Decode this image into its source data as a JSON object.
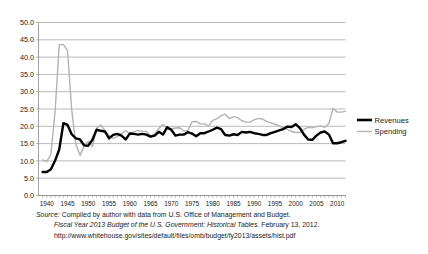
{
  "figure": {
    "background": "#ffffff",
    "plot_frame_color": "#8c8c8c",
    "grid_color": "#8c8c8c"
  },
  "legend": {
    "position": "right",
    "items": [
      {
        "label": "Revenues",
        "color": "#000000",
        "width": 2.6
      },
      {
        "label": "Spending",
        "color": "#b3b3b3",
        "width": 1.4
      }
    ]
  },
  "source": {
    "label": "Source:",
    "line1": "Compiled by author with data from U.S. Office of Management and Budget.",
    "line2_title": "Fiscal Year 2013 Budget of the U.S. Government: Historical Tables.",
    "line2_date": "February 13, 2012.",
    "line3_url": "http://www.whitehouse.gov/sites/default/files/omb/budget/fy2013/assets/hist.pdf"
  },
  "chart_data": {
    "type": "line",
    "title": "",
    "xlabel": "",
    "ylabel": "",
    "xlim": [
      1938,
      2012
    ],
    "ylim": [
      0.0,
      50.0
    ],
    "grid": true,
    "legend_position": "right",
    "ytick_labels": [
      "0.0",
      "5.0",
      "10.0",
      "15.0",
      "20.0",
      "25.0",
      "30.0",
      "35.0",
      "40.0",
      "45.0",
      "50.0"
    ],
    "ytick_values": [
      0,
      5,
      10,
      15,
      20,
      25,
      30,
      35,
      40,
      45,
      50
    ],
    "xtick_labels": [
      "1940",
      "1945",
      "1950",
      "1955",
      "1960",
      "1965",
      "1970",
      "1975",
      "1980",
      "1985",
      "1990",
      "1995",
      "2000",
      "2005",
      "2010"
    ],
    "xtick_values": [
      1940,
      1945,
      1950,
      1955,
      1960,
      1965,
      1970,
      1975,
      1980,
      1985,
      1990,
      1995,
      2000,
      2005,
      2010
    ],
    "x": [
      1939,
      1940,
      1941,
      1942,
      1943,
      1944,
      1945,
      1946,
      1947,
      1948,
      1949,
      1950,
      1951,
      1952,
      1953,
      1954,
      1955,
      1956,
      1957,
      1958,
      1959,
      1960,
      1961,
      1962,
      1963,
      1964,
      1965,
      1966,
      1967,
      1968,
      1969,
      1970,
      1971,
      1972,
      1973,
      1974,
      1975,
      1976,
      1977,
      1978,
      1979,
      1980,
      1981,
      1982,
      1983,
      1984,
      1985,
      1986,
      1987,
      1988,
      1989,
      1990,
      1991,
      1992,
      1993,
      1994,
      1995,
      1996,
      1997,
      1998,
      1999,
      2000,
      2001,
      2002,
      2003,
      2004,
      2005,
      2006,
      2007,
      2008,
      2009,
      2010,
      2011,
      2012
    ],
    "series": [
      {
        "name": "Revenues",
        "color": "#000000",
        "values": [
          6.8,
          6.8,
          7.6,
          10.1,
          13.3,
          20.9,
          20.4,
          17.7,
          16.5,
          16.2,
          14.5,
          14.4,
          16.1,
          19.0,
          18.7,
          18.5,
          16.5,
          17.5,
          17.8,
          17.3,
          16.2,
          17.9,
          17.8,
          17.6,
          17.8,
          17.6,
          17.0,
          17.3,
          18.4,
          17.6,
          19.7,
          19.0,
          17.3,
          17.6,
          17.6,
          18.3,
          17.9,
          17.1,
          18.0,
          18.0,
          18.5,
          19.0,
          19.6,
          19.2,
          17.5,
          17.3,
          17.7,
          17.5,
          18.4,
          18.2,
          18.4,
          18.0,
          17.8,
          17.5,
          17.5,
          18.0,
          18.4,
          18.8,
          19.2,
          19.9,
          19.8,
          20.6,
          19.5,
          17.6,
          16.2,
          16.1,
          17.3,
          18.2,
          18.5,
          17.6,
          15.1,
          15.1,
          15.4,
          15.8
        ]
      },
      {
        "name": "Spending",
        "color": "#b3b3b3",
        "values": [
          10.3,
          9.8,
          12.0,
          24.3,
          43.6,
          43.6,
          41.9,
          24.8,
          14.8,
          11.6,
          14.3,
          15.6,
          14.2,
          19.4,
          20.4,
          18.8,
          17.3,
          16.5,
          17.0,
          17.9,
          18.8,
          17.8,
          18.4,
          18.8,
          18.6,
          18.5,
          17.2,
          17.8,
          19.4,
          20.5,
          19.4,
          19.3,
          19.5,
          19.6,
          18.7,
          18.7,
          21.3,
          21.4,
          20.7,
          20.7,
          20.1,
          21.7,
          22.2,
          23.1,
          23.5,
          22.2,
          22.8,
          22.5,
          21.6,
          21.2,
          21.2,
          21.9,
          22.3,
          22.1,
          21.4,
          21.0,
          20.6,
          20.2,
          19.5,
          19.1,
          18.5,
          18.2,
          18.2,
          19.1,
          19.7,
          19.6,
          19.9,
          20.1,
          19.7,
          20.8,
          25.2,
          24.1,
          24.1,
          24.3
        ]
      }
    ]
  }
}
